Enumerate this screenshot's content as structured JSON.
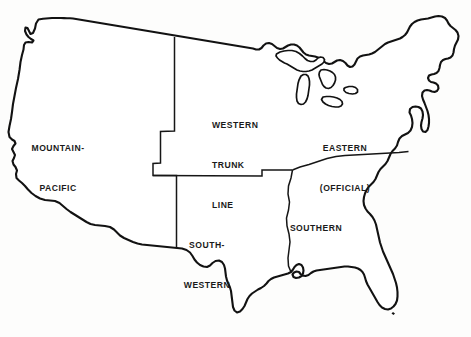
{
  "figure": {
    "name": "us-railroad-rate-territory-map",
    "background_color": "#fdfdfc",
    "line_color": "#121212",
    "text_color": "#1a1a1a",
    "width": 471,
    "height": 337
  },
  "regions": [
    {
      "id": "mountain-pacific",
      "lines": [
        "MOUNTAIN-",
        "PACIFIC"
      ],
      "align": "center",
      "x": 58,
      "y": 116
    },
    {
      "id": "western-trunk-line",
      "lines": [
        "WESTERN",
        "TRUNK",
        "LINE"
      ],
      "align": "left",
      "x": 212,
      "y": 93
    },
    {
      "id": "eastern-official",
      "lines": [
        "EASTERN",
        "(OFFICIAL)"
      ],
      "align": "center",
      "x": 345,
      "y": 116
    },
    {
      "id": "south-western",
      "lines": [
        "SOUTH-",
        "WESTERN"
      ],
      "align": "center",
      "x": 207,
      "y": 213
    },
    {
      "id": "southern",
      "lines": [
        "SOUTHERN"
      ],
      "align": "center",
      "x": 316,
      "y": 196
    }
  ],
  "labels": {
    "mountain_pacific_line1": "MOUNTAIN-",
    "mountain_pacific_line2": "PACIFIC",
    "western_trunk_line1": "WESTERN",
    "western_trunk_line2": "TRUNK",
    "western_trunk_line3": "LINE",
    "eastern_line1": "EASTERN",
    "eastern_line2": "(OFFICIAL)",
    "south_western_line1": "SOUTH-",
    "south_western_line2": "WESTERN",
    "southern_line1": "SOUTHERN"
  },
  "geometry": {
    "country_outline": "M 38.5 19.5 L 36.0 23.5 L 35.0 28.5 L 33.0 33.0 L 30.5 34.0 L 29.0 31.0 L 27.5 28.0 L 25.5 27.5 L 25.0 31.0 L 26.5 34.5 L 28.5 37.0 L 31.0 39.0 L 33.5 40.5 L 32.0 42.5 L 28.5 42.0 L 25.5 42.5 L 24.0 45.0 L 23.5 49.5 L 22.0 55.0 L 20.5 62.0 L 19.5 70.0 L 18.0 79.0 L 16.0 88.0 L 14.5 96.0 L 13.0 104.0 L 12.0 112.0 L 11.0 119.0 L 9.5 126.0 L 8.5 132.0 L 9.5 137.0 L 12.0 139.5 L 14.5 141.0 L 15.5 143.5 L 13.5 146.0 L 12.0 149.0 L 13.5 152.0 L 15.0 155.0 L 14.0 158.0 L 12.5 161.0 L 13.5 164.5 L 15.5 167.0 L 17.0 170.5 L 16.0 174.0 L 16.5 178.0 L 19.0 180.5 L 22.0 183.0 L 25.0 186.0 L 28.0 189.5 L 31.5 193.0 L 35.5 196.0 L 40.0 198.5 L 45.0 200.0 L 50.0 200.5 L 55.0 201.0 L 59.5 203.0 L 63.0 206.0 L 66.5 209.0 L 70.5 212.0 L 74.5 214.5 L 78.5 217.0 L 82.5 219.5 L 86.5 222.0 L 90.5 224.0 L 95.0 225.0 L 100.0 225.5 L 105.0 226.0 L 110.0 227.0 L 114.0 229.5 L 117.0 232.5 L 120.0 235.5 L 124.0 238.0 L 128.5 240.0 L 133.0 242.0 L 137.5 243.5 L 142.0 244.5 L 147.0 245.0 L 152.0 245.5 L 157.0 246.0 L 162.0 246.5 L 167.0 247.0 L 172.0 247.5 L 177.0 248.0 L 182.0 248.5 L 186.5 250.0 L 190.0 252.5 L 192.5 256.0 L 194.5 259.5 L 197.0 262.5 L 200.0 265.0 L 203.5 266.5 L 207.0 267.0 L 210.0 265.5 L 212.5 263.0 L 215.5 261.0 L 219.0 260.5 L 222.0 262.0 L 224.0 265.0 L 225.0 268.5 L 225.5 272.5 L 226.0 276.5 L 227.0 280.5 L 228.5 284.0 L 230.0 287.5 L 231.0 291.0 L 231.5 295.0 L 232.0 299.0 L 232.5 303.0 L 233.0 307.0 L 234.5 310.5 L 237.0 312.5 L 240.0 311.5 L 242.5 309.0 L 244.5 306.0 L 246.0 302.5 L 247.5 299.0 L 249.5 296.0 L 252.0 293.5 L 255.0 291.5 L 258.0 289.5 L 261.0 288.0 L 264.0 286.0 L 266.5 283.5 L 268.5 281.0 L 271.0 279.0 L 274.0 277.5 L 277.5 276.5 L 281.0 275.5 L 284.5 274.5 L 288.0 273.5 L 291.0 272.0 L 293.0 269.5 L 294.5 267.0 L 296.5 265.0 L 299.0 264.0 L 301.5 265.0 L 303.0 267.5 L 303.5 270.5 L 303.0 273.5 L 301.5 276.0 L 299.0 277.5 L 296.0 278.0 L 293.5 277.0 L 292.5 274.5 L 294.0 272.5 L 296.5 271.5 L 299.0 272.0 L 300.5 274.0 L 302.5 275.5 L 305.5 276.0 L 308.5 275.0 L 311.0 273.0 L 313.5 271.5 L 316.5 270.5 L 320.0 270.0 L 323.5 269.5 L 327.0 269.0 L 330.5 268.5 L 334.0 268.0 L 337.5 267.5 L 341.0 267.0 L 344.5 266.5 L 348.0 266.5 L 351.5 267.0 L 355.0 267.5 L 358.0 268.5 L 360.5 270.0 L 362.5 272.0 L 364.0 274.5 L 365.0 277.5 L 366.0 281.0 L 367.5 284.5 L 369.5 288.0 L 371.5 291.5 L 373.5 295.0 L 375.5 298.5 L 377.5 302.0 L 379.5 305.0 L 382.0 307.5 L 385.0 309.0 L 388.0 309.5 L 391.0 308.5 L 393.5 306.5 L 395.5 304.0 L 397.0 300.5 L 397.5 296.5 L 397.5 292.0 L 397.0 287.5 L 396.0 283.0 L 394.5 278.5 L 393.0 274.0 L 391.0 269.5 L 389.0 265.0 L 387.0 260.5 L 385.0 256.0 L 383.0 251.5 L 381.5 247.0 L 380.0 242.5 L 379.0 238.0 L 378.0 233.5 L 377.0 229.0 L 376.0 224.5 L 374.5 220.5 L 372.5 217.0 L 370.0 214.0 L 367.5 211.5 L 365.5 208.5 L 364.0 205.0 L 363.5 201.0 L 364.0 197.0 L 365.0 193.5 L 366.5 190.0 L 368.5 187.0 L 371.0 184.5 L 373.5 182.0 L 375.5 179.0 L 377.0 175.5 L 378.5 172.0 L 380.5 169.0 L 383.0 166.5 L 385.5 164.0 L 387.5 161.0 L 389.0 157.5 L 390.5 154.0 L 392.5 151.0 L 395.0 148.5 L 397.0 145.5 L 398.0 142.0 L 399.5 138.5 L 402.0 136.0 L 405.0 134.5 L 408.0 133.0 L 410.5 130.5 L 412.0 127.0 L 412.5 123.0 L 412.0 119.0 L 411.0 115.5 L 409.5 112.5 L 410.0 109.0 L 412.5 107.0 L 415.5 106.5 L 418.5 107.0 L 421.0 108.5 L 422.5 111.5 L 423.0 115.0 L 422.5 118.5 L 421.5 122.0 L 421.0 125.5 L 421.5 129.0 L 423.0 131.5 L 425.5 132.0 L 427.5 130.0 L 428.5 126.5 L 429.0 123.0 L 429.0 119.0 L 428.5 115.0 L 427.5 111.0 L 426.0 107.0 L 424.5 103.0 L 423.0 99.5 L 422.0 96.0 L 422.5 92.5 L 424.5 90.5 L 427.0 90.0 L 429.5 90.5 L 432.0 91.5 L 434.5 92.0 L 437.0 91.0 L 438.5 88.5 L 438.0 85.5 L 436.0 83.5 L 433.5 82.5 L 431.0 82.0 L 429.0 80.5 L 428.0 78.0 L 429.0 75.5 L 431.5 74.5 L 434.0 74.0 L 436.5 73.0 L 438.5 71.0 L 439.5 68.0 L 440.0 65.0 L 441.0 62.0 L 443.0 60.0 L 445.5 59.0 L 448.0 58.5 L 450.5 57.5 L 452.5 55.5 L 453.5 52.5 L 454.0 49.0 L 455.0 45.5 L 456.5 42.5 L 458.0 39.5 L 458.5 36.0 L 457.5 32.5 L 455.5 30.0 L 453.0 28.0 L 450.5 26.0 L 448.5 23.5 L 447.0 20.5 L 445.0 18.0 L 442.0 16.5 L 438.5 16.0 L 435.0 16.5 L 431.5 17.5 L 428.0 18.5 L 424.5 19.0 L 421.0 19.5 L 417.5 20.5 L 414.5 22.0 L 412.0 24.0 L 410.0 26.5 L 408.5 29.5 L 407.0 32.5 L 405.0 35.0 L 402.5 37.0 L 400.0 38.5 L 397.0 39.5 L 394.0 40.5 L 391.0 41.5 L 388.0 42.5 L 385.0 44.0 L 382.5 46.0 L 380.0 48.0 L 377.5 50.0 L 375.0 52.0 L 372.0 53.5 L 369.0 54.5 L 366.0 55.0 L 363.0 55.5 L 360.0 56.5 L 357.5 58.5 L 356.0 61.5 L 354.5 64.5 L 352.5 66.5 L 350.0 67.0 L 347.5 65.5 L 345.5 63.0 L 343.0 61.0 L 340.0 60.0 L 337.0 60.5 L 334.5 62.0 L 332.0 63.5 L 329.0 64.0 L 326.0 63.0 L 323.5 61.0 L 321.0 59.0 L 318.0 57.5 L 315.0 56.5 L 312.0 56.0 L 309.0 55.5 L 306.0 54.5 L 303.5 52.5 L 301.5 50.0 L 299.5 47.5 L 297.0 45.5 L 294.0 44.5 L 291.0 44.5 L 288.0 45.5 L 285.5 47.0 L 283.0 48.5 L 280.0 49.0 L 277.0 48.0 L 274.5 46.0 L 272.0 44.0 L 269.0 43.0 L 266.0 43.5 L 263.5 45.5 L 261.5 48.0 L 259.0 49.5 L 256.0 49.5 L 253.0 48.5 L 250.0 48.0 L 247.0 47.5 L 244.0 47.0 L 241.0 46.5 L 238.0 46.0 L 235.0 45.5 L 232.0 45.0 L 229.0 44.5 L 226.0 44.0 L 223.0 43.5 L 220.0 43.0 L 217.0 42.5 L 214.0 42.0 L 211.0 41.5 L 208.0 41.0 L 205.0 40.5 L 202.0 40.0 L 199.0 39.5 L 196.0 39.0 L 193.0 38.5 L 190.0 38.0 L 187.0 37.5 L 184.0 37.0 L 181.0 36.5 L 178.0 36.0 L 175.0 35.5 L 172.0 35.0 L 169.0 34.5 L 166.0 34.0 L 163.0 33.5 L 160.0 33.0 L 157.0 32.5 L 154.0 32.0 L 151.0 31.5 L 148.0 31.0 L 145.0 30.5 L 142.0 30.0 L 139.0 29.5 L 136.0 29.0 L 133.0 28.5 L 130.0 28.0 L 127.0 27.5 L 124.0 27.0 L 121.0 26.5 L 118.0 26.0 L 115.0 25.5 L 112.0 25.0 L 109.0 24.5 L 106.0 24.0 L 103.0 23.5 L 100.0 23.0 L 97.0 22.5 L 94.0 22.0 L 91.0 21.5 L 88.0 21.0 L 85.0 20.5 L 82.0 20.0 L 79.0 19.5 L 76.0 19.0 L 73.0 18.5 L 70.0 18.3 L 67.0 18.2 L 64.0 18.1 L 61.0 18.0 L 58.0 18.0 L 55.0 18.0 L 52.0 18.0 L 49.0 18.2 L 46.0 18.5 L 43.0 18.8 L 40.0 19.2 Z",
    "lake_superior": "M 276.5 54.0 L 280.0 52.0 L 284.0 51.0 L 288.0 50.5 L 292.0 50.5 L 296.0 51.5 L 299.5 53.5 L 302.5 56.0 L 305.0 58.5 L 307.5 60.5 L 310.5 61.5 L 313.5 61.5 L 316.0 60.0 L 318.0 58.0 L 320.5 57.0 L 323.0 57.5 L 324.5 59.5 L 324.0 62.0 L 322.0 64.0 L 319.5 65.5 L 317.0 67.0 L 314.5 68.5 L 312.0 70.0 L 309.0 71.0 L 306.0 71.5 L 303.0 71.5 L 300.0 71.0 L 297.0 70.0 L 294.5 68.5 L 292.0 67.0 L 289.5 65.5 L 287.0 64.0 L 284.5 63.0 L 282.0 61.5 L 279.5 60.0 L 277.5 58.0 L 276.0 56.0 Z",
    "lake_michigan": "M 301.0 76.0 L 303.5 74.5 L 306.0 74.5 L 308.0 76.0 L 309.0 78.5 L 309.5 81.5 L 309.5 85.0 L 309.0 88.5 L 308.5 92.0 L 308.0 95.5 L 307.0 99.0 L 305.5 102.0 L 303.5 104.0 L 301.0 104.5 L 298.5 103.5 L 297.0 101.0 L 296.5 97.5 L 296.5 94.0 L 297.0 90.5 L 297.5 87.0 L 298.0 83.5 L 299.0 80.0 Z",
    "lake_huron": "M 321.0 70.0 L 324.0 69.5 L 327.0 70.0 L 330.0 71.0 L 332.5 72.5 L 334.5 74.5 L 335.5 77.0 L 335.5 80.0 L 334.5 83.0 L 333.0 85.5 L 331.0 87.5 L 328.5 88.5 L 326.0 88.0 L 324.0 86.5 L 322.5 84.5 L 321.5 82.0 L 320.5 79.5 L 319.5 77.0 L 319.0 74.5 L 319.5 72.0 Z",
    "lake_erie": "M 323.0 97.0 L 326.5 96.5 L 330.0 96.5 L 333.5 97.0 L 337.0 98.0 L 340.0 99.5 L 342.0 101.5 L 342.5 104.0 L 341.0 106.0 L 338.5 107.0 L 335.5 107.0 L 332.0 106.5 L 328.5 105.5 L 325.5 104.0 L 323.0 102.0 L 321.5 99.5 Z",
    "lake_ontario": "M 345.5 87.5 L 349.0 86.5 L 352.5 86.5 L 355.5 87.5 L 357.5 89.5 L 357.5 92.0 L 355.5 93.5 L 352.5 94.0 L 349.0 93.5 L 346.0 92.5 L 344.0 90.5 L 344.0 88.5 Z",
    "divider_mountain_pacific": "M 174.5 37.0 L 174.5 131.0 L 160.5 131.5 L 160.5 163.0 L 153.0 163.5 L 153.0 175.5 L 176.5 175.5 L 176.5 247.5",
    "divider_southwestern_north": "M 153.0 175.5 L 262.0 176.0 L 262.0 170.0 L 292.5 170.0",
    "divider_mississippi": "M 292.5 170.0 L 291.0 178.0 L 288.5 186.0 L 288.0 194.0 L 289.5 202.0 L 288.5 210.0 L 286.5 218.0 L 287.0 226.0 L 289.0 234.0 L 290.0 242.0 L 289.0 250.0 L 288.0 258.0 L 288.5 266.0 L 291.0 272.0",
    "divider_eastern_southern": "M 292.5 170.0 L 300.0 167.0 L 309.0 164.5 L 318.0 161.5 L 327.0 158.5 L 336.0 156.5 L 345.0 155.5 L 354.0 155.0 L 363.0 154.5 L 372.0 154.0 L 381.0 153.5 L 390.0 153.0 L 399.0 152.5 L 408.5 151.5",
    "florida_key": "M 393.0 312.0 L 395.0 313.5 L 393.5 315.0 L 391.5 313.5 Z"
  }
}
